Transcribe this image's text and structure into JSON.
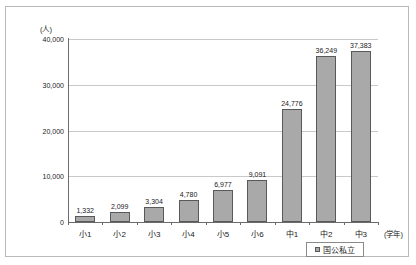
{
  "chart_data": {
    "type": "bar",
    "title": "",
    "categories": [
      "小1",
      "小2",
      "小3",
      "小4",
      "小5",
      "小6",
      "中1",
      "中2",
      "中3"
    ],
    "values": [
      1332,
      2099,
      3304,
      4780,
      6977,
      9091,
      24776,
      36249,
      37383
    ],
    "value_labels": [
      "1,332",
      "2,099",
      "3,304",
      "4,780",
      "6,977",
      "9,091",
      "24,776",
      "36,249",
      "37,383"
    ],
    "series": [
      {
        "name": "国公私立",
        "values": [
          1332,
          2099,
          3304,
          4780,
          6977,
          9091,
          24776,
          36249,
          37383
        ]
      }
    ],
    "xlabel": "(学年)",
    "ylabel": "(人)",
    "ylim": [
      0,
      40000
    ],
    "ytick_labels": [
      "0",
      "10,000",
      "20,000",
      "30,000",
      "40,000"
    ],
    "ytick_values": [
      0,
      10000,
      20000,
      30000,
      40000
    ],
    "grid": true,
    "legend_position": "bottom-right",
    "legend_entries": [
      "国公私立"
    ],
    "bar_color": "#a9a9a9",
    "bar_border_color": "#595959",
    "grid_color": "#c9c9c9",
    "axis_color": "#6b6b6b"
  },
  "legend": {
    "label": "国公私立"
  }
}
